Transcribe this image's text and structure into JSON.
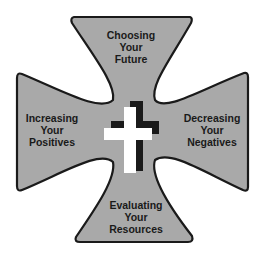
{
  "diagram": {
    "type": "maltese-cross",
    "colors": {
      "fill": "#a9a9a9",
      "outline": "#1a1a1a",
      "cross": "#ffffff",
      "shadow": "#1a1a1a",
      "background": "#ffffff"
    },
    "arms": {
      "top": {
        "lines": [
          "Choosing",
          "Your",
          "Future"
        ]
      },
      "left": {
        "lines": [
          "Increasing",
          "Your",
          "Positives"
        ]
      },
      "right": {
        "lines": [
          "Decreasing",
          "Your",
          "Negatives"
        ]
      },
      "bottom": {
        "lines": [
          "Evaluating",
          "Your",
          "Resources"
        ]
      }
    },
    "center_icon": "christian-cross-icon"
  }
}
